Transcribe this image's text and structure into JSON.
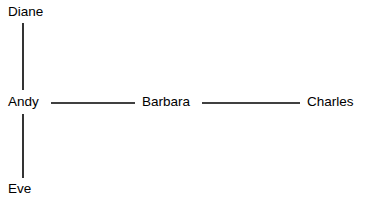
{
  "diagram": {
    "type": "node-link-graph",
    "width": 368,
    "height": 203,
    "background_color": "#ffffff",
    "line_color": "#000000",
    "text_color": "#000000",
    "nodes": [
      {
        "id": "diane",
        "label": "Diane",
        "x": 8,
        "y": 4
      },
      {
        "id": "andy",
        "label": "Andy",
        "x": 8,
        "y": 94
      },
      {
        "id": "barbara",
        "label": "Barbara",
        "x": 142,
        "y": 94
      },
      {
        "id": "charles",
        "label": "Charles",
        "x": 307,
        "y": 94
      },
      {
        "id": "eve",
        "label": "Eve",
        "x": 8,
        "y": 181
      }
    ],
    "edges": [
      {
        "id": "edge-diane-andy",
        "from": "diane",
        "to": "andy",
        "orientation": "vertical",
        "x1": 23,
        "y1": 23,
        "x2": 23,
        "y2": 90
      },
      {
        "id": "edge-andy-barbara",
        "from": "andy",
        "to": "barbara",
        "orientation": "horizontal",
        "x1": 51,
        "y1": 103,
        "x2": 135,
        "y2": 103
      },
      {
        "id": "edge-barbara-charles",
        "from": "barbara",
        "to": "charles",
        "orientation": "horizontal",
        "x1": 202,
        "y1": 103,
        "x2": 300,
        "y2": 103
      },
      {
        "id": "edge-andy-eve",
        "from": "andy",
        "to": "eve",
        "orientation": "vertical",
        "x1": 23,
        "y1": 114,
        "x2": 23,
        "y2": 178
      }
    ]
  }
}
